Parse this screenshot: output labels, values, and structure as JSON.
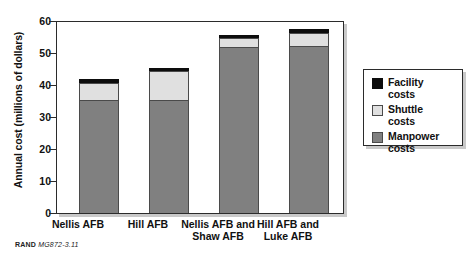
{
  "chart_data": {
    "type": "bar",
    "stacked": true,
    "title": "",
    "xlabel": "",
    "ylabel": "Annual cost (millions of dollars)",
    "ylim": [
      0,
      60
    ],
    "yticks": [
      0,
      10,
      20,
      30,
      40,
      50,
      60
    ],
    "grid": false,
    "legend_position": "right",
    "categories": [
      "Nellis AFB",
      "Hill AFB",
      "Nellis AFB and Shaw AFB",
      "Hill AFB and Luke AFB"
    ],
    "series": [
      {
        "name": "Manpower costs",
        "color": "#808080",
        "values": [
          35.2,
          35.2,
          51.5,
          52.0
        ]
      },
      {
        "name": "Shuttle costs",
        "color": "#e0e0e0",
        "values": [
          5.3,
          8.8,
          3.0,
          4.0
        ]
      },
      {
        "name": "Facility costs",
        "color": "#0d0d0d",
        "values": [
          1.3,
          1.0,
          1.0,
          1.2
        ]
      }
    ],
    "totals": [
      41.8,
      45.0,
      55.5,
      57.2
    ]
  },
  "axis": {
    "y_title": "Annual cost (millions of dollars)",
    "y_ticks": [
      "60",
      "50",
      "40",
      "30",
      "20",
      "10",
      "0"
    ]
  },
  "categories": [
    {
      "line1": "Nellis AFB",
      "line2": ""
    },
    {
      "line1": "Hill AFB",
      "line2": ""
    },
    {
      "line1": "Nellis AFB and",
      "line2": "Shaw AFB"
    },
    {
      "line1": "Hill AFB and",
      "line2": "Luke AFB"
    }
  ],
  "legend": {
    "items": [
      {
        "label_line1": "Facility",
        "label_line2": "costs",
        "color": "#0d0d0d",
        "icon": "facility-swatch"
      },
      {
        "label_line1": "Shuttle",
        "label_line2": "costs",
        "color": "#e0e0e0",
        "icon": "shuttle-swatch"
      },
      {
        "label_line1": "Manpower",
        "label_line2": "costs",
        "color": "#808080",
        "icon": "manpower-swatch"
      }
    ]
  },
  "source_note": {
    "org": "RAND",
    "code": "MG872-3.11"
  }
}
